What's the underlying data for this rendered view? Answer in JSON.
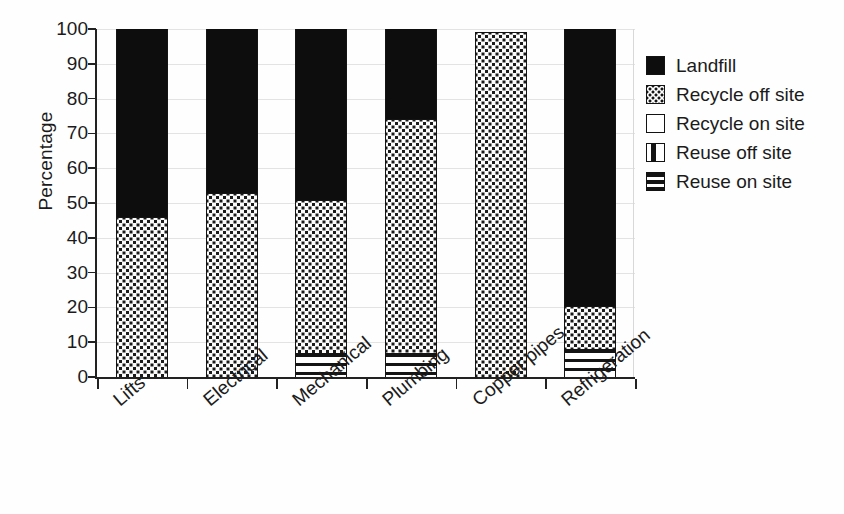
{
  "chart_data": {
    "type": "bar",
    "subtype": "stacked-bar",
    "title": "",
    "xlabel": "",
    "ylabel": "Percentage",
    "ylim": [
      0,
      100
    ],
    "yticks": [
      0,
      10,
      20,
      30,
      40,
      50,
      60,
      70,
      80,
      90,
      100
    ],
    "grid": true,
    "grid_axis": "y",
    "legend_position": "right",
    "categories": [
      "Lifts",
      "Electrical",
      "Mechanical",
      "Plumbing",
      "Copper pipes",
      "Refrigeration"
    ],
    "series": [
      {
        "name": "Reuse on site",
        "pattern": "horizontal-stripes",
        "values": [
          0,
          0,
          7,
          7,
          0,
          8
        ]
      },
      {
        "name": "Reuse off site",
        "pattern": "vertical-stripes",
        "values": [
          0,
          0,
          0,
          0,
          0,
          0
        ]
      },
      {
        "name": "Recycle on site",
        "pattern": "white",
        "values": [
          0,
          0,
          0,
          0,
          0,
          0
        ]
      },
      {
        "name": "Recycle off site",
        "pattern": "dotted",
        "values": [
          46,
          53,
          44,
          67,
          99,
          12.5
        ]
      },
      {
        "name": "Landfill",
        "pattern": "solid-black",
        "values": [
          54,
          47,
          49,
          26,
          0,
          79.5
        ]
      }
    ],
    "stack_order_bottom_to_top": [
      "Reuse on site",
      "Reuse off site",
      "Recycle on site",
      "Recycle off site",
      "Landfill"
    ]
  },
  "axes": {
    "y_label": "Percentage",
    "y_tick_labels": [
      "100",
      "90",
      "80",
      "70",
      "60",
      "50",
      "40",
      "30",
      "20",
      "10",
      "0"
    ],
    "x_tick_labels": [
      "Lifts",
      "Electrical",
      "Mechanical",
      "Plumbing",
      "Copper pipes",
      "Refrigeration"
    ]
  },
  "legend": {
    "items": [
      {
        "label": "Landfill",
        "swatch": "solid-black-swatch-icon"
      },
      {
        "label": "Recycle off site",
        "swatch": "dotted-swatch-icon"
      },
      {
        "label": "Recycle on site",
        "swatch": "white-swatch-icon"
      },
      {
        "label": "Reuse off site",
        "swatch": "vertical-stripe-swatch-icon"
      },
      {
        "label": "Reuse on site",
        "swatch": "horizontal-stripe-swatch-icon"
      }
    ]
  },
  "colors": {
    "ink": "#141414",
    "paper": "#fefefe",
    "gridline": "#e3e3e3"
  }
}
